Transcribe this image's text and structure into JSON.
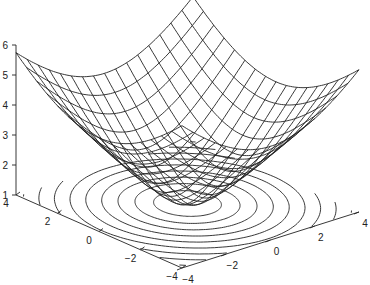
{
  "chart_data": {
    "type": "surface",
    "title": "",
    "function": "z = sqrt(x^2 + y^2 + 1)",
    "x_range": [
      -4,
      4
    ],
    "y_range": [
      -4,
      4
    ],
    "grid_step": 0.5,
    "zlim": [
      1,
      6
    ],
    "x_ticks": [
      -4,
      -2,
      0,
      2,
      4
    ],
    "y_ticks": [
      -4,
      -2,
      0,
      2,
      4
    ],
    "z_ticks": [
      1,
      2,
      3,
      4,
      5,
      6
    ],
    "contour_levels": [
      1.5,
      2,
      2.5,
      3,
      3.5,
      4,
      4.5,
      5,
      5.5
    ],
    "contour_plane_z": 1,
    "xlabel": "",
    "ylabel": "",
    "zlabel": "",
    "grid": false,
    "line_color": "#222222"
  },
  "projection": {
    "left_corner": [
      16,
      195
    ],
    "front_corner": [
      182,
      268
    ],
    "right_corner": [
      359,
      212
    ],
    "z_pixels_per_unit": 30
  }
}
